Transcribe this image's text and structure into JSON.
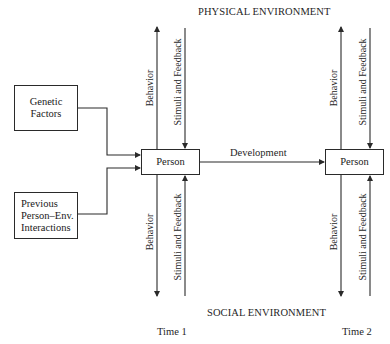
{
  "diagram": {
    "top_label": "PHYSICAL ENVIRONMENT",
    "bottom_label": "SOCIAL ENVIRONMENT",
    "inputs": [
      {
        "id": "genetic",
        "lines": [
          "Genetic",
          "Factors"
        ]
      },
      {
        "id": "previous",
        "lines": [
          "Previous",
          "Person–Env.",
          "Interactions"
        ]
      }
    ],
    "nodes": [
      {
        "id": "person-t1",
        "label": "Person",
        "time_label": "Time 1"
      },
      {
        "id": "person-t2",
        "label": "Person",
        "time_label": "Time 2"
      }
    ],
    "edge_labels": {
      "development": "Development",
      "behavior": "Behavior",
      "stimuli": "Stimuli and Feedback"
    },
    "colors": {
      "line": "#2a2a2a",
      "text": "#1f1f1f",
      "background": "#ffffff"
    }
  }
}
